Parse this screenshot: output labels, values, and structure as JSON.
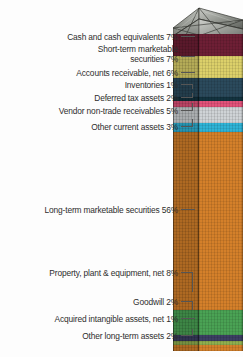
{
  "chart_data": {
    "type": "bar",
    "title": "",
    "subtitle": "",
    "xlabel": "",
    "ylabel": "",
    "orientation": "vertical-stacked-3d",
    "units": "percent of total assets",
    "total": 100,
    "categories": [
      "Cash and cash equivalents",
      "Short-term marketable securities",
      "Accounts receivable, net",
      "Inventories",
      "Deferred tax assets",
      "Vendor non-trade receivables",
      "Other current assets",
      "Long-term marketable securities",
      "Property, plant & equipment, net",
      "Goodwill",
      "Acquired intangible assets, net",
      "Other long-term assets"
    ],
    "values": [
      7,
      7,
      6,
      1,
      2,
      5,
      3,
      56,
      8,
      2,
      1,
      2
    ],
    "colors": [
      "#6e1f35",
      "#dcd06a",
      "#2b4a5c",
      "#13333f",
      "#e2527a",
      "#cfd3d6",
      "#2fb3d6",
      "#d4802a",
      "#4aa254",
      "#3c3f63",
      "#8fae4e",
      "#d4802a"
    ],
    "legend": "none",
    "grid": false
  },
  "segments": [
    {
      "id": "cash",
      "label": "Cash and cash equivalents 7%",
      "value": 7,
      "color": "#6e1f35"
    },
    {
      "id": "st-mkt",
      "label": "Short-term marketable\nsecurities 7%",
      "value": 7,
      "color": "#dcd06a"
    },
    {
      "id": "ar",
      "label": "Accounts receivable, net 6%",
      "value": 6,
      "color": "#2b4a5c"
    },
    {
      "id": "inventories",
      "label": "Inventories 1%",
      "value": 1,
      "color": "#13333f"
    },
    {
      "id": "deferred",
      "label": "Deferred tax assets 2%",
      "value": 2,
      "color": "#e2527a"
    },
    {
      "id": "vendor",
      "label": "Vendor non-trade receivables 5%",
      "value": 5,
      "color": "#cfd3d6"
    },
    {
      "id": "other-cur",
      "label": "Other current assets 3%",
      "value": 3,
      "color": "#2fb3d6"
    },
    {
      "id": "lt-mkt",
      "label": "Long-term marketable securities 56%",
      "value": 56,
      "color": "#d4802a"
    },
    {
      "id": "ppe",
      "label": "Property, plant & equipment, net 8%",
      "value": 8,
      "color": "#4aa254"
    },
    {
      "id": "goodwill",
      "label": "Goodwill 2%",
      "value": 2,
      "color": "#3c3f63"
    },
    {
      "id": "intangible",
      "label": "Acquired intangible assets, net 1%",
      "value": 1,
      "color": "#8fae4e"
    },
    {
      "id": "other-lt",
      "label": "Other long-term assets 2%",
      "value": 2,
      "color": "#d4802a"
    }
  ],
  "cap": {
    "name": "glass-pyramid-cap",
    "glass_color": "#8d8f8a",
    "frame_color": "#3a3a38"
  }
}
